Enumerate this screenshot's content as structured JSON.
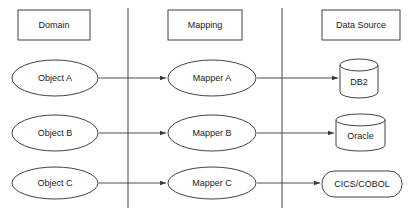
{
  "diagram": {
    "background_color": "#ffffff",
    "stroke_color": "#2b2b2b",
    "divider_color": "#555555",
    "text_color": "#1a1a1a",
    "columns": [
      {
        "id": "domain",
        "header": "Domain"
      },
      {
        "id": "mapping",
        "header": "Mapping"
      },
      {
        "id": "data_source",
        "header": "Data Source"
      }
    ],
    "dividers": [
      {
        "id": "divider-1",
        "x": 128,
        "y1": 8,
        "y2": 208
      },
      {
        "id": "divider-2",
        "x": 282,
        "y1": 8,
        "y2": 208
      }
    ],
    "headers": [
      {
        "id": "header-domain",
        "label": "Domain",
        "x": 18,
        "y": 10,
        "w": 72,
        "h": 30
      },
      {
        "id": "header-mapping",
        "label": "Mapping",
        "x": 168,
        "y": 10,
        "w": 74,
        "h": 30
      },
      {
        "id": "header-data-source",
        "label": "Data Source",
        "x": 322,
        "y": 10,
        "w": 78,
        "h": 30
      }
    ],
    "rows": [
      {
        "id": "row-a",
        "domain": {
          "label": "Object A",
          "shape": "ellipse",
          "cx": 55,
          "cy": 78,
          "rx": 43,
          "ry": 18
        },
        "mapping": {
          "label": "Mapper A",
          "shape": "ellipse",
          "cx": 212,
          "cy": 78,
          "rx": 44,
          "ry": 18
        },
        "data_source": {
          "label": "DB2",
          "shape": "cylinder",
          "x": 340,
          "y": 59,
          "w": 38,
          "h": 39
        },
        "arrows": [
          {
            "id": "arrow-a1",
            "x1": 99,
            "y1": 78,
            "x2": 166,
            "y2": 78
          },
          {
            "id": "arrow-a2",
            "x1": 257,
            "y1": 78,
            "x2": 338,
            "y2": 78
          }
        ]
      },
      {
        "id": "row-b",
        "domain": {
          "label": "Object B",
          "shape": "ellipse",
          "cx": 55,
          "cy": 133,
          "rx": 43,
          "ry": 18
        },
        "mapping": {
          "label": "Mapper B",
          "shape": "ellipse",
          "cx": 212,
          "cy": 133,
          "rx": 44,
          "ry": 18
        },
        "data_source": {
          "label": "Oracle",
          "shape": "cylinder",
          "x": 336,
          "y": 114,
          "w": 49,
          "h": 37
        },
        "arrows": [
          {
            "id": "arrow-b1",
            "x1": 99,
            "y1": 133,
            "x2": 166,
            "y2": 133
          },
          {
            "id": "arrow-b2",
            "x1": 257,
            "y1": 133,
            "x2": 334,
            "y2": 133
          }
        ]
      },
      {
        "id": "row-c",
        "domain": {
          "label": "Object C",
          "shape": "ellipse",
          "cx": 55,
          "cy": 183,
          "rx": 43,
          "ry": 16
        },
        "mapping": {
          "label": "Mapper C",
          "shape": "ellipse",
          "cx": 212,
          "cy": 183,
          "rx": 44,
          "ry": 16
        },
        "data_source": {
          "label": "CICS/COBOL",
          "shape": "rounded-rect",
          "x": 322,
          "y": 171,
          "w": 80,
          "h": 26
        },
        "arrows": [
          {
            "id": "arrow-c1",
            "x1": 99,
            "y1": 183,
            "x2": 166,
            "y2": 183
          },
          {
            "id": "arrow-c2",
            "x1": 257,
            "y1": 183,
            "x2": 320,
            "y2": 183
          }
        ]
      }
    ]
  }
}
